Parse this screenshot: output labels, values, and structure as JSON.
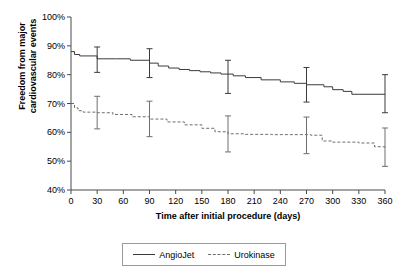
{
  "chart_data": {
    "type": "line",
    "title": "",
    "xlabel": "Time after initial procedure (days)",
    "ylabel": "Freedom from major cardiovascular events",
    "xlim": [
      0,
      360
    ],
    "ylim": [
      40,
      100
    ],
    "xticks": [
      0,
      30,
      60,
      90,
      120,
      150,
      180,
      210,
      240,
      270,
      300,
      330,
      360
    ],
    "xtick_labels": [
      "0",
      "30",
      "60",
      "90",
      "120",
      "150",
      "180",
      "210",
      "240",
      "270",
      "300",
      "330",
      "360"
    ],
    "yticks": [
      40,
      50,
      60,
      70,
      80,
      90,
      100
    ],
    "ytick_labels": [
      "40%",
      "50%",
      "60%",
      "70%",
      "80%",
      "90%",
      "100%"
    ],
    "grid": false,
    "legend_position": "bottom-center",
    "series": [
      {
        "name": "AngioJet",
        "style": "solid",
        "color": "#3b3b3b",
        "step": "post",
        "x": [
          0,
          4,
          10,
          16,
          30,
          52,
          68,
          90,
          100,
          112,
          124,
          136,
          148,
          160,
          172,
          186,
          200,
          218,
          240,
          256,
          270,
          290,
          300,
          312,
          322,
          360
        ],
        "y": [
          88,
          87,
          86.5,
          86.5,
          85.5,
          85.5,
          85,
          84,
          83,
          82.3,
          81.8,
          81.4,
          81,
          80.6,
          80.2,
          79.6,
          79,
          78.2,
          77.5,
          77,
          76.5,
          75.8,
          74.8,
          74.2,
          73.2,
          73.2
        ],
        "error_bars": [
          {
            "x": 30,
            "y": 85.3,
            "low": 80.8,
            "high": 89.6
          },
          {
            "x": 90,
            "y": 84.0,
            "low": 79.0,
            "high": 89.0
          },
          {
            "x": 180,
            "y": 79.3,
            "low": 73.5,
            "high": 85.0
          },
          {
            "x": 270,
            "y": 76.5,
            "low": 70.5,
            "high": 82.5
          },
          {
            "x": 360,
            "y": 73.2,
            "low": 66.8,
            "high": 80.0
          }
        ]
      },
      {
        "name": "Urokinase",
        "style": "dashed",
        "color": "#6e6e6e",
        "step": "post",
        "x": [
          0,
          4,
          8,
          14,
          22,
          30,
          48,
          70,
          90,
          110,
          130,
          150,
          165,
          180,
          200,
          230,
          260,
          275,
          288,
          300,
          330,
          348,
          360
        ],
        "y": [
          70,
          68.5,
          67.5,
          67,
          67,
          66.8,
          66.2,
          65.4,
          64.6,
          63.6,
          62.6,
          61.4,
          60.2,
          59.5,
          59.3,
          59.2,
          59.2,
          59.0,
          57.0,
          56.6,
          56.3,
          55.0,
          54.8
        ],
        "error_bars": [
          {
            "x": 30,
            "y": 66.8,
            "low": 61.2,
            "high": 72.5
          },
          {
            "x": 90,
            "y": 64.6,
            "low": 58.5,
            "high": 70.8
          },
          {
            "x": 180,
            "y": 59.5,
            "low": 53.2,
            "high": 65.7
          },
          {
            "x": 270,
            "y": 59.0,
            "low": 52.6,
            "high": 65.3
          },
          {
            "x": 360,
            "y": 54.8,
            "low": 48.2,
            "high": 61.5
          }
        ]
      }
    ]
  },
  "legend": {
    "entries": [
      {
        "label": "AngioJet",
        "style": "solid"
      },
      {
        "label": "Urokinase",
        "style": "dashed"
      }
    ]
  },
  "colors": {
    "angiojet": "#3b3b3b",
    "urokinase": "#6e6e6e",
    "axis": "#4a4a4a",
    "background": "#ffffff"
  }
}
